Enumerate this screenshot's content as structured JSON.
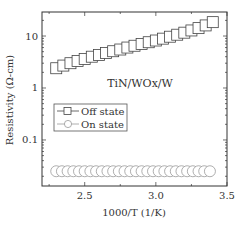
{
  "chart_data": {
    "type": "scatter",
    "title": "",
    "annotation": "TiN/WOx/W",
    "xlabel": "1000/T (1/K)",
    "ylabel": "Resistivity (Ω-cm)",
    "xlim": [
      2.2,
      3.5
    ],
    "ylim": [
      0.013,
      29
    ],
    "yscale": "log",
    "grid": false,
    "legend_position": "center-left",
    "xticks": [
      2.5,
      3.0,
      3.5
    ],
    "xtick_labels": [
      "2.5",
      "3.0",
      "3.5"
    ],
    "yticks": [
      0.1,
      1,
      10
    ],
    "ytick_labels": [
      "0.1",
      "1",
      "10"
    ],
    "series": [
      {
        "name": "Off state",
        "marker": "square-open",
        "x": [
          2.3,
          2.35,
          2.4,
          2.45,
          2.5,
          2.55,
          2.6,
          2.65,
          2.7,
          2.75,
          2.8,
          2.85,
          2.9,
          2.95,
          3.0,
          3.05,
          3.1,
          3.15,
          3.2,
          3.25,
          3.3,
          3.35,
          3.4
        ],
        "values": [
          2.4,
          2.7,
          3.0,
          3.3,
          3.6,
          4.0,
          4.3,
          4.7,
          5.1,
          5.5,
          6.0,
          6.5,
          7.0,
          7.6,
          8.2,
          8.9,
          9.7,
          10.6,
          11.6,
          12.8,
          14.2,
          16.0,
          18.5
        ]
      },
      {
        "name": "On state",
        "marker": "circle-open",
        "x": [
          2.3,
          2.34,
          2.38,
          2.42,
          2.46,
          2.5,
          2.54,
          2.58,
          2.62,
          2.66,
          2.7,
          2.74,
          2.78,
          2.82,
          2.86,
          2.9,
          2.94,
          2.98,
          3.02,
          3.06,
          3.1,
          3.14,
          3.18,
          3.22,
          3.26,
          3.3,
          3.34,
          3.38
        ],
        "values": [
          0.025,
          0.025,
          0.025,
          0.025,
          0.025,
          0.025,
          0.025,
          0.025,
          0.025,
          0.025,
          0.025,
          0.025,
          0.025,
          0.025,
          0.025,
          0.025,
          0.025,
          0.025,
          0.025,
          0.025,
          0.025,
          0.025,
          0.025,
          0.025,
          0.025,
          0.025,
          0.025,
          0.025
        ]
      }
    ]
  },
  "colors": {
    "off_state": "#444444",
    "on_state": "#999999",
    "axis": "#333333"
  },
  "layout": {
    "plot_left": 42,
    "plot_right": 227,
    "plot_top": 12,
    "plot_bottom": 186
  }
}
